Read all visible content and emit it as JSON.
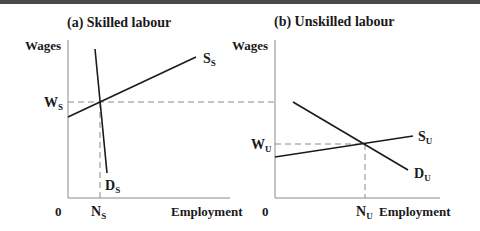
{
  "panels": [
    {
      "id": "a",
      "title": "(a) Skilled labour",
      "y_axis_label": "Wages",
      "x_axis_label": "Employment",
      "origin_label": "0",
      "wage_label": {
        "main": "W",
        "sub": "S"
      },
      "employment_label": {
        "main": "N",
        "sub": "S"
      },
      "supply_label": {
        "main": "S",
        "sub": "S"
      },
      "demand_label": {
        "main": "D",
        "sub": "S"
      }
    },
    {
      "id": "b",
      "title": "(b) Unskilled labour",
      "y_axis_label": "Wages",
      "x_axis_label": "Employment",
      "origin_label": "0",
      "wage_label": {
        "main": "W",
        "sub": "U"
      },
      "employment_label": {
        "main": "N",
        "sub": "U"
      },
      "supply_label": {
        "main": "S",
        "sub": "U"
      },
      "demand_label": {
        "main": "D",
        "sub": "U"
      }
    }
  ],
  "colors": {
    "line": "#1a1a1a",
    "axis": "#8a8a8a",
    "dashed": "#8a8a8a",
    "top_bar": "#4a4a4a"
  }
}
